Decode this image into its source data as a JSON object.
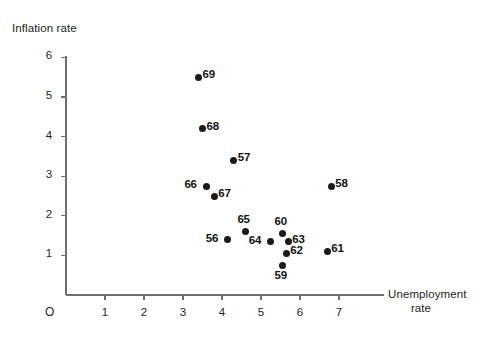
{
  "chart_data": {
    "type": "scatter",
    "title": "",
    "xlabel": "Unemployment rate",
    "ylabel": "Inflation rate",
    "origin_label": "O",
    "xlim": [
      0,
      7.9
    ],
    "ylim": [
      0,
      6.5
    ],
    "xticks": [
      "1",
      "2",
      "3",
      "4",
      "5",
      "6",
      "7"
    ],
    "xtick_values": [
      1,
      2,
      3,
      4,
      5,
      6,
      7
    ],
    "yticks": [
      "1",
      "2",
      "3",
      "4",
      "5",
      "6"
    ],
    "ytick_values": [
      1,
      2,
      3,
      4,
      5,
      6
    ],
    "grid": false,
    "legend": "none",
    "point_color": "#1a1a1a",
    "axis_color": "#6d6e71",
    "points": [
      {
        "label": "69",
        "x": 3.4,
        "y": 5.5,
        "label_pos": "right"
      },
      {
        "label": "68",
        "x": 3.5,
        "y": 4.2,
        "label_pos": "right"
      },
      {
        "label": "57",
        "x": 4.3,
        "y": 3.4,
        "label_pos": "right"
      },
      {
        "label": "66",
        "x": 3.6,
        "y": 2.75,
        "label_pos": "left"
      },
      {
        "label": "67",
        "x": 3.8,
        "y": 2.5,
        "label_pos": "right"
      },
      {
        "label": "58",
        "x": 6.8,
        "y": 2.75,
        "label_pos": "right"
      },
      {
        "label": "65",
        "x": 4.6,
        "y": 1.6,
        "label_pos": "above"
      },
      {
        "label": "56",
        "x": 4.15,
        "y": 1.4,
        "label_pos": "left"
      },
      {
        "label": "64",
        "x": 5.25,
        "y": 1.35,
        "label_pos": "left"
      },
      {
        "label": "60",
        "x": 5.55,
        "y": 1.55,
        "label_pos": "above"
      },
      {
        "label": "63",
        "x": 5.7,
        "y": 1.35,
        "label_pos": "right"
      },
      {
        "label": "62",
        "x": 5.65,
        "y": 1.05,
        "label_pos": "right"
      },
      {
        "label": "59",
        "x": 5.55,
        "y": 0.75,
        "label_pos": "below"
      },
      {
        "label": "61",
        "x": 6.7,
        "y": 1.1,
        "label_pos": "right"
      }
    ]
  }
}
